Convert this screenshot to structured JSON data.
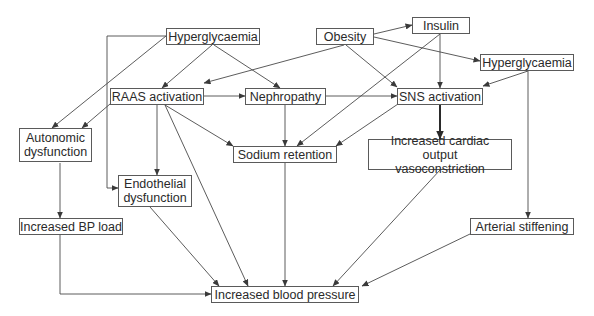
{
  "nodes": {
    "hyper1": {
      "label": "Hyperglycaemia"
    },
    "obesity": {
      "label": "Obesity"
    },
    "insulin": {
      "label": "Insulin"
    },
    "hyper2": {
      "label": "Hyperglycaemia"
    },
    "raas": {
      "label": "RAAS activation"
    },
    "nephro": {
      "label": "Nephropathy"
    },
    "sns": {
      "label": "SNS activation"
    },
    "autonomic": {
      "label": "Autonomic\ndysfunction"
    },
    "sodium": {
      "label": "Sodium retention"
    },
    "cardiac": {
      "label": "Increased cardiac output\nvasoconstriction"
    },
    "endo": {
      "label": "Endothelial\ndysfunction"
    },
    "bpload": {
      "label": "Increased BP load"
    },
    "arterial": {
      "label": "Arterial stiffening"
    },
    "bp": {
      "label": "Increased blood pressure"
    }
  },
  "edges": [
    {
      "from": "hyper1",
      "to": "raas"
    },
    {
      "from": "hyper1",
      "to": "nephro"
    },
    {
      "from": "hyper1",
      "to": "autonomic"
    },
    {
      "from": "hyper1",
      "to": "endo",
      "routing": "elbow-left"
    },
    {
      "from": "obesity",
      "to": "raas"
    },
    {
      "from": "obesity",
      "to": "sns"
    },
    {
      "from": "obesity",
      "to": "insulin"
    },
    {
      "from": "obesity",
      "to": "hyper2"
    },
    {
      "from": "insulin",
      "to": "sns"
    },
    {
      "from": "insulin",
      "to": "sodium"
    },
    {
      "from": "hyper2",
      "to": "sns"
    },
    {
      "from": "hyper2",
      "to": "arterial"
    },
    {
      "from": "raas",
      "to": "nephro"
    },
    {
      "from": "raas",
      "to": "autonomic"
    },
    {
      "from": "raas",
      "to": "sodium"
    },
    {
      "from": "raas",
      "to": "endo"
    },
    {
      "from": "raas",
      "to": "bp"
    },
    {
      "from": "nephro",
      "to": "sns"
    },
    {
      "from": "nephro",
      "to": "sodium"
    },
    {
      "from": "sns",
      "to": "sodium"
    },
    {
      "from": "sns",
      "to": "cardiac",
      "bold": true
    },
    {
      "from": "autonomic",
      "to": "bpload"
    },
    {
      "from": "sodium",
      "to": "bp"
    },
    {
      "from": "cardiac",
      "to": "bp"
    },
    {
      "from": "endo",
      "to": "bp"
    },
    {
      "from": "bpload",
      "to": "bp",
      "routing": "elbow-down"
    },
    {
      "from": "arterial",
      "to": "bp"
    }
  ]
}
